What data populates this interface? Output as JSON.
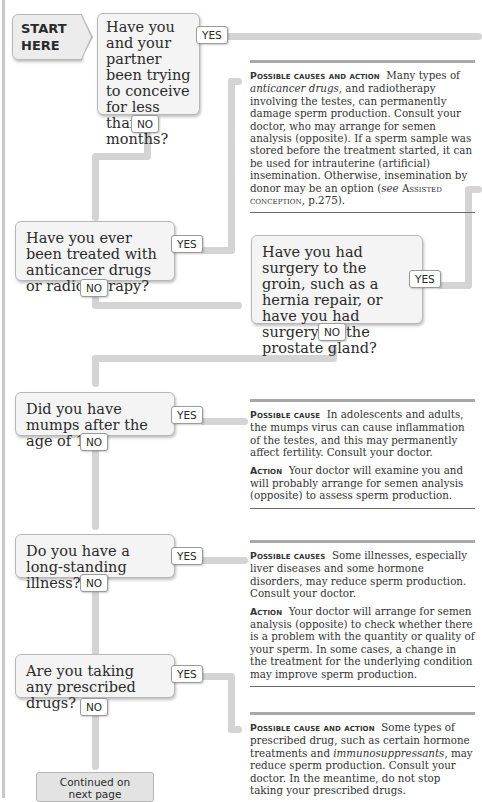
{
  "start": {
    "line1": "START",
    "line2": "HERE"
  },
  "labels": {
    "yes": "YES",
    "no": "NO"
  },
  "questions": [
    {
      "id": "q1",
      "text": "Have you and your partner been trying to conceive for less than 6 months?"
    },
    {
      "id": "q2",
      "text": "Have you ever been treated with anticancer drugs or radiotherapy?"
    },
    {
      "id": "q3",
      "text": "Have you had surgery to the groin, such as a hernia repair, or have you had surgery on the prostate gland?"
    },
    {
      "id": "q4",
      "text": "Did you have mumps after the age of 12?"
    },
    {
      "id": "q5",
      "text": "Do you have a long-standing illness?"
    },
    {
      "id": "q6",
      "text": "Are you taking any prescribed drugs?"
    }
  ],
  "panels": [
    {
      "id": "anticancer",
      "heading": "Possible causes and action",
      "body_parts": [
        "Many types of ",
        "anticancer drugs",
        ", and radiotherapy involving the testes, can permanently damage sperm production. Consult your doctor, who may arrange for semen analysis (opposite). If a sperm sample was stored before the treatment started, it can be used for intrauterine (artificial) insemination. Otherwise, insemination by donor may be an option (",
        "see",
        " ",
        "Assisted conception",
        ", p.275)."
      ]
    },
    {
      "id": "mumps",
      "heading1": "Possible cause",
      "body1": "In adolescents and adults, the mumps virus can cause inflammation of the testes, and this may permanently affect fertility. Consult your doctor.",
      "heading2": "Action",
      "body2": "Your doctor will examine you and will probably arrange for semen analysis (opposite) to assess sperm production."
    },
    {
      "id": "illness",
      "heading1": "Possible causes",
      "body1": "Some illnesses, especially liver diseases and some hormone disorders, may reduce sperm production. Consult your doctor.",
      "heading2": "Action",
      "body2": "Your doctor will arrange for semen analysis (opposite) to check whether there is a problem with the quantity or quality of your sperm. In some cases, a change in the treatment for the underlying condition may improve sperm production."
    },
    {
      "id": "drugs",
      "heading": "Possible cause and action",
      "body_parts": [
        "Some types of prescribed drug, such as certain hormone treatments and ",
        "immunosuppressants",
        ", may reduce sperm production. Consult your doctor. In the meantime, do not stop taking your prescribed drugs."
      ]
    }
  ],
  "continued": {
    "line1": "Continued on",
    "line2": "next page"
  },
  "colors": {
    "flow": "#d4d4d4",
    "box_bg": "#f4f4f4",
    "box_border": "#b8b8b8",
    "rule": "#a8a8a8"
  }
}
